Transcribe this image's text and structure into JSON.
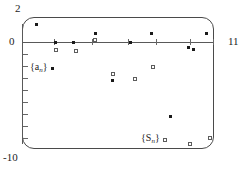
{
  "chart_data": {
    "type": "scatter",
    "title": "",
    "xlabel": "",
    "ylabel": "",
    "xlim": [
      0,
      11
    ],
    "ylim": [
      -10,
      2
    ],
    "grid": false,
    "legend_position": "inside-plot",
    "axis_labels": {
      "y_max": "2",
      "y_zero": "0",
      "y_min": "-10",
      "x_max": "11"
    },
    "x_ticks": [
      2,
      4,
      6,
      8,
      10
    ],
    "y_ticks": [
      -1,
      -2,
      -3,
      -4,
      -5,
      -6,
      -7,
      -8,
      -9
    ],
    "series": [
      {
        "name": "{a_n}",
        "legend_text": "{a",
        "legend_sub": "n",
        "legend_close": "}",
        "marker": "dot",
        "x": [
          1,
          2,
          3,
          4,
          5,
          6,
          7,
          8,
          9,
          10,
          11
        ],
        "y": [
          1.6,
          -0.05,
          0.0,
          0.9,
          -3.1,
          -0.1,
          0.65,
          -5.9,
          -0.4,
          -0.5,
          0.7
        ]
      },
      {
        "name": "{S_n}",
        "legend_text": "{S",
        "legend_sub": "n",
        "legend_close": "}",
        "marker": "square",
        "x": [
          2,
          3,
          4,
          5,
          6,
          7,
          8,
          9,
          10
        ],
        "y": [
          -0.6,
          -0.65,
          0.45,
          -2.8,
          -3.0,
          -2.2,
          -8.6,
          -9.1,
          -8.8
        ]
      }
    ]
  },
  "markers": {
    "a_points": [
      {
        "left": 35,
        "top": 23,
        "label": "a1"
      },
      {
        "left": 54,
        "top": 41,
        "label": "a2"
      },
      {
        "left": 72,
        "top": 41,
        "label": "a3"
      },
      {
        "left": 94,
        "top": 32,
        "label": "a4"
      },
      {
        "left": 111,
        "top": 79,
        "label": "a5"
      },
      {
        "left": 129,
        "top": 41,
        "label": "a6"
      },
      {
        "left": 150,
        "top": 32,
        "label": "a7"
      },
      {
        "left": 169,
        "top": 115,
        "label": "a8"
      },
      {
        "left": 187,
        "top": 46,
        "label": "a9"
      },
      {
        "left": 192,
        "top": 48,
        "label": "a10"
      },
      {
        "left": 205,
        "top": 32,
        "label": "a11"
      }
    ],
    "s_points": [
      {
        "left": 54,
        "top": 48,
        "label": "s2"
      },
      {
        "left": 74,
        "top": 49,
        "label": "s3"
      },
      {
        "left": 93,
        "top": 38,
        "label": "s4"
      },
      {
        "left": 111,
        "top": 72,
        "label": "s5"
      },
      {
        "left": 133,
        "top": 77,
        "label": "s6"
      },
      {
        "left": 151,
        "top": 65,
        "label": "s7"
      },
      {
        "left": 163,
        "top": 138,
        "label": "s8"
      },
      {
        "left": 188,
        "top": 142,
        "label": "s9"
      },
      {
        "left": 208,
        "top": 136,
        "label": "s10"
      }
    ],
    "x_tick_positions": [
      54,
      92,
      128,
      156,
      190,
      213
    ],
    "y_tick_positions": [
      54,
      66,
      78,
      90,
      102,
      114,
      126,
      138
    ]
  }
}
